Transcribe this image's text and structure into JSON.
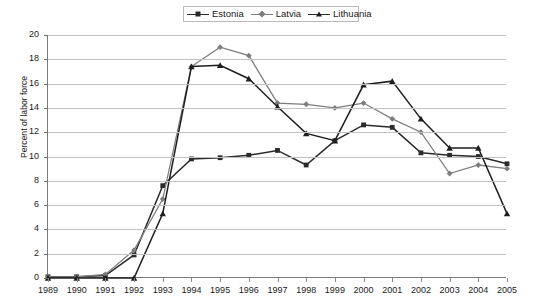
{
  "legend": {
    "position": "top-center",
    "entries": [
      {
        "label": "Estonia",
        "marker": "square",
        "color": "#2b2b2b"
      },
      {
        "label": "Latvia",
        "marker": "diamond",
        "color": "#7d7d7d"
      },
      {
        "label": "Lithuania",
        "marker": "triangle",
        "color": "#1f1f1f"
      }
    ]
  },
  "axes": {
    "ylabel": "Percent of labor force",
    "yticks": [
      0,
      2,
      4,
      6,
      8,
      10,
      12,
      14,
      16,
      18,
      20
    ],
    "xticks": [
      "1989",
      "1990",
      "1991",
      "1992",
      "1993",
      "1994",
      "1995",
      "1996",
      "1997",
      "1998",
      "1999",
      "2000",
      "2001",
      "2002",
      "2003",
      "2004",
      "2005"
    ]
  },
  "chart_data": {
    "type": "line",
    "title": "",
    "xlabel": "",
    "ylabel": "Percent of labor force",
    "ylim": [
      0,
      20
    ],
    "ytick_step": 2,
    "grid": true,
    "legend_position": "top-center",
    "categories": [
      "1989",
      "1990",
      "1991",
      "1992",
      "1993",
      "1994",
      "1995",
      "1996",
      "1997",
      "1998",
      "1999",
      "2000",
      "2001",
      "2002",
      "2003",
      "2004",
      "2005"
    ],
    "series": [
      {
        "name": "Estonia",
        "marker": "square",
        "color": "#2b2b2b",
        "values": [
          0.1,
          0.1,
          0.2,
          1.9,
          7.6,
          9.8,
          9.9,
          10.1,
          10.5,
          9.3,
          11.3,
          12.6,
          12.4,
          10.3,
          10.1,
          10.0,
          9.4
        ]
      },
      {
        "name": "Latvia",
        "marker": "diamond",
        "color": "#7d7d7d",
        "values": [
          0.1,
          0.1,
          0.3,
          2.3,
          6.5,
          17.4,
          19.0,
          18.3,
          14.4,
          14.3,
          14.0,
          14.4,
          13.1,
          12.0,
          8.6,
          9.3,
          9.0
        ]
      },
      {
        "name": "Lithuania",
        "marker": "triangle",
        "color": "#1f1f1f",
        "values": [
          0.0,
          0.0,
          0.0,
          0.0,
          5.3,
          17.4,
          17.5,
          16.4,
          14.1,
          11.9,
          11.3,
          15.9,
          16.2,
          13.1,
          10.7,
          10.7,
          5.3
        ]
      }
    ]
  }
}
